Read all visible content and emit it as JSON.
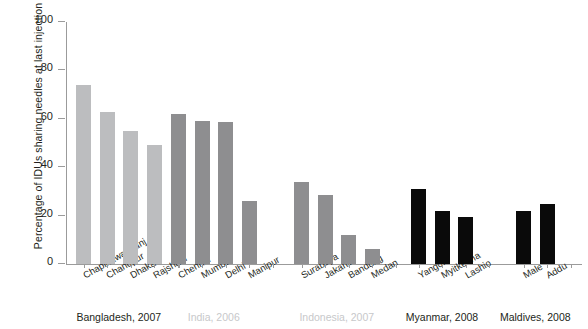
{
  "chart_data": {
    "type": "bar",
    "title": "",
    "subtitle": "",
    "xlabel": "",
    "ylabel": "Percentage of IDUs sharing needles at last injection",
    "ylim": [
      0,
      100
    ],
    "yticks": [
      0,
      20,
      40,
      60,
      80,
      100
    ],
    "ytick_labels": [
      "0",
      "20",
      "40",
      "60",
      "80",
      "100"
    ],
    "grid": false,
    "legend": "none",
    "categories": [
      "Chapinawabganj",
      "Chandpur",
      "Dhaka",
      "Rajshahi",
      "Chennai",
      "Mumbai",
      "Delhi",
      "Manipur",
      "Surabaya",
      "Jakarta",
      "Bandung",
      "Medan",
      "Yangon",
      "Myitkeena",
      "Lashio",
      "Male",
      "Addu"
    ],
    "values": [
      74,
      63,
      55,
      49,
      62,
      59,
      58.5,
      26,
      34,
      28.5,
      12,
      6,
      31,
      22,
      19.5,
      22,
      25
    ],
    "groups": [
      {
        "label": "Bangladesh, 2007",
        "label_color": "#231f20",
        "bar_color": "#bcbdbf",
        "categories": [
          "Chapinawabganj",
          "Chandpur",
          "Dhaka",
          "Rajshahi"
        ],
        "values": [
          74,
          63,
          55,
          49
        ]
      },
      {
        "label": "India, 2006",
        "label_color": "#c7c8ca",
        "bar_color": "#8e8e90",
        "categories": [
          "Chennai",
          "Mumbai",
          "Delhi",
          "Manipur"
        ],
        "values": [
          62,
          59,
          58.5,
          26
        ]
      },
      {
        "label": "Indonesia, 2007",
        "label_color": "#c7c8ca",
        "bar_color": "#8e8e90",
        "categories": [
          "Surabaya",
          "Jakarta",
          "Bandung",
          "Medan"
        ],
        "values": [
          34,
          28.5,
          12,
          6
        ]
      },
      {
        "label": "Myanmar, 2008",
        "label_color": "#231f20",
        "bar_color": "#0a0a0a",
        "categories": [
          "Yangon",
          "Myitkeena",
          "Lashio"
        ],
        "values": [
          31,
          22,
          19.5
        ]
      },
      {
        "label": "Maldives, 2008",
        "label_color": "#231f20",
        "bar_color": "#0a0a0a",
        "categories": [
          "Male",
          "Addu"
        ],
        "values": [
          22,
          25
        ]
      }
    ]
  }
}
